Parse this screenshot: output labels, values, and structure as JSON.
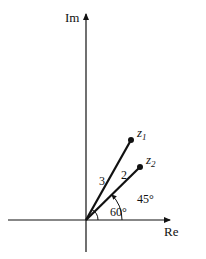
{
  "axes": {
    "x_label": "Re",
    "y_label": "Im"
  },
  "vectors": [
    {
      "name": "z",
      "subscript": "1",
      "modulus_label": "3",
      "angle_label": "60°",
      "angle_deg": 60,
      "modulus": 3
    },
    {
      "name": "z",
      "subscript": "2",
      "modulus_label": "2",
      "angle_label": "45°",
      "angle_deg": 45,
      "modulus": 2
    }
  ],
  "colors": {
    "ink": "#111111",
    "background": "#ffffff"
  }
}
